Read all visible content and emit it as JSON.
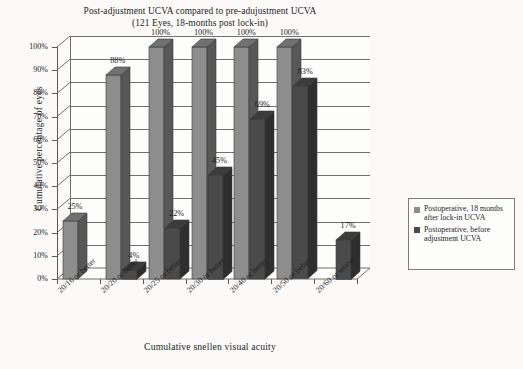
{
  "chart_data": {
    "type": "bar",
    "title": "Post-adjustment UCVA compared to pre-adujustment UCVA",
    "subtitle": "(121 Eyes, 18-months post lock-in)",
    "xlabel": "Cumulative snellen visual acuity",
    "ylabel": "Cumulative percentage of eyes",
    "ylim": [
      0,
      100
    ],
    "ytick_labels": [
      "100%",
      "90%",
      "80%",
      "70%",
      "60%",
      "50%",
      "40%",
      "30%",
      "20%",
      "10%",
      "0%"
    ],
    "ytick_values": [
      100,
      90,
      80,
      70,
      60,
      50,
      40,
      30,
      20,
      10,
      0
    ],
    "grid": true,
    "legend_position": "right",
    "categories": [
      "20/16 or better",
      "20/20 or better",
      "20/25 or better",
      "20/30 or better",
      "20/40 or better",
      "20/50 or better",
      "20/60 or worse"
    ],
    "series": [
      {
        "name": "Postoperative, 18 months after lock-in UCVA",
        "color": "#8d8d8d",
        "values": [
          25,
          88,
          100,
          100,
          100,
          100,
          0
        ],
        "labels": [
          "25%",
          "88%",
          "100%",
          "100%",
          "100%",
          "100%",
          ""
        ]
      },
      {
        "name": "Postoperative, before adjustment UCVA",
        "color": "#4a4a4a",
        "values": [
          0,
          4,
          22,
          45,
          69,
          83,
          17
        ],
        "labels": [
          "",
          "4%",
          "22%",
          "45%",
          "69%",
          "83%",
          "17%"
        ]
      }
    ]
  },
  "legend": {
    "entries": [
      {
        "label": "Postoperative, 18 months after lock-in UCVA",
        "color": "#8d8d8d"
      },
      {
        "label": "Postoperative, before adjustment UCVA",
        "color": "#4a4a4a"
      }
    ]
  }
}
